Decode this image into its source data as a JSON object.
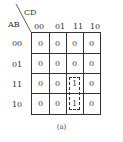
{
  "kmap": {
    "corner": {
      "row_var": "AB",
      "col_var": "CD"
    },
    "col_headers": [
      "00",
      "01",
      "11",
      "10"
    ],
    "row_headers": [
      "00",
      "01",
      "11",
      "10"
    ],
    "cells": [
      [
        "0",
        "0",
        "0",
        "0"
      ],
      [
        "0",
        "0",
        "0",
        "0"
      ],
      [
        "0",
        "0",
        "1",
        "0"
      ],
      [
        "0",
        "0",
        "1",
        "0"
      ]
    ],
    "groups": [
      {
        "rows": [
          2,
          3
        ],
        "col": 2,
        "style": "dashed"
      }
    ]
  },
  "caption": "(a)"
}
